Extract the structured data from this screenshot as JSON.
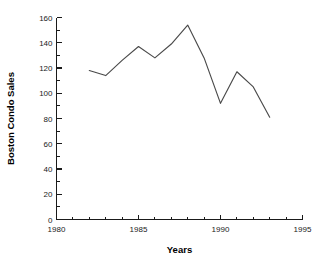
{
  "chart_data": {
    "type": "line",
    "title": "",
    "xlabel": "Years",
    "ylabel": "Boston Condo Sales",
    "x": [
      1982,
      1983,
      1984,
      1985,
      1986,
      1987,
      1988,
      1989,
      1990,
      1991,
      1992,
      1993
    ],
    "values": [
      118,
      114,
      126,
      137,
      128,
      139,
      154,
      128,
      92,
      117,
      105,
      81
    ],
    "series": [
      {
        "name": "Boston Condo Sales",
        "values": [
          118,
          114,
          126,
          137,
          128,
          139,
          154,
          128,
          92,
          117,
          105,
          81
        ]
      }
    ],
    "xlim": [
      1980,
      1995
    ],
    "ylim": [
      0,
      160
    ],
    "x_tick_labels": [
      "1980",
      "1985",
      "1990",
      "1995"
    ],
    "x_tick_values": [
      1980,
      1985,
      1990,
      1995
    ],
    "x_minor_tick_interval": 1,
    "y_tick_labels": [
      "0",
      "20",
      "40",
      "60",
      "80",
      "100",
      "120",
      "140",
      "160"
    ],
    "y_tick_values": [
      0,
      20,
      40,
      60,
      80,
      100,
      120,
      140,
      160
    ],
    "y_minor_tick_interval": 10,
    "grid": false,
    "legend": false,
    "legend_position": "none",
    "line_color": "#4a4a4a",
    "axis_color": "#1a1a1a",
    "background_color": "#ffffff"
  },
  "axis": {
    "y_label": "Boston Condo Sales",
    "x_label": "Years",
    "x_ticks": [
      {
        "label": "1980",
        "value": 1980
      },
      {
        "label": "1985",
        "value": 1985
      },
      {
        "label": "1990",
        "value": 1990
      },
      {
        "label": "1995",
        "value": 1995
      }
    ],
    "y_ticks": [
      {
        "label": "0",
        "value": 0
      },
      {
        "label": "20",
        "value": 20
      },
      {
        "label": "40",
        "value": 40
      },
      {
        "label": "60",
        "value": 60
      },
      {
        "label": "80",
        "value": 80
      },
      {
        "label": "100",
        "value": 100
      },
      {
        "label": "120",
        "value": 120
      },
      {
        "label": "140",
        "value": 140
      },
      {
        "label": "160",
        "value": 160
      }
    ]
  }
}
